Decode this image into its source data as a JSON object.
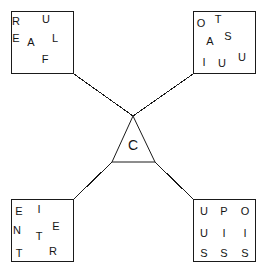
{
  "diagram": {
    "canvas": {
      "width": 267,
      "height": 275,
      "background": "#ffffff"
    },
    "stroke_color": "#1a1a1a",
    "center": {
      "shape": "triangle",
      "label": "C",
      "apex": {
        "x": 133,
        "y": 116
      },
      "bottom_left": {
        "x": 112,
        "y": 162
      },
      "bottom_right": {
        "x": 155,
        "y": 162
      },
      "label_pos": {
        "x": 133,
        "y": 145
      }
    },
    "boxes": [
      {
        "id": "top-left",
        "x": 11,
        "y": 11,
        "w": 63,
        "h": 63,
        "letters": [
          {
            "ch": "R",
            "x": 16,
            "y": 21
          },
          {
            "ch": "U",
            "x": 46,
            "y": 19
          },
          {
            "ch": "E",
            "x": 16,
            "y": 38
          },
          {
            "ch": "A",
            "x": 31,
            "y": 42
          },
          {
            "ch": "L",
            "x": 55,
            "y": 38
          },
          {
            "ch": "F",
            "x": 45,
            "y": 59
          }
        ]
      },
      {
        "id": "top-right",
        "x": 193,
        "y": 11,
        "w": 63,
        "h": 63,
        "letters": [
          {
            "ch": "O",
            "x": 201,
            "y": 23
          },
          {
            "ch": "T",
            "x": 218,
            "y": 19
          },
          {
            "ch": "A",
            "x": 210,
            "y": 41
          },
          {
            "ch": "S",
            "x": 228,
            "y": 36
          },
          {
            "ch": "I",
            "x": 204,
            "y": 62
          },
          {
            "ch": "U",
            "x": 222,
            "y": 63
          },
          {
            "ch": "U",
            "x": 242,
            "y": 57
          }
        ]
      },
      {
        "id": "bottom-left",
        "x": 11,
        "y": 199,
        "w": 63,
        "h": 63,
        "letters": [
          {
            "ch": "E",
            "x": 19,
            "y": 211
          },
          {
            "ch": "I",
            "x": 39,
            "y": 209
          },
          {
            "ch": "N",
            "x": 17,
            "y": 230
          },
          {
            "ch": "T",
            "x": 39,
            "y": 236
          },
          {
            "ch": "E",
            "x": 56,
            "y": 226
          },
          {
            "ch": "T",
            "x": 19,
            "y": 253
          },
          {
            "ch": "R",
            "x": 53,
            "y": 251
          }
        ]
      },
      {
        "id": "bottom-right",
        "x": 193,
        "y": 199,
        "w": 63,
        "h": 63,
        "letters": [
          {
            "ch": "U",
            "x": 204,
            "y": 211
          },
          {
            "ch": "P",
            "x": 224,
            "y": 211
          },
          {
            "ch": "O",
            "x": 245,
            "y": 211
          },
          {
            "ch": "U",
            "x": 204,
            "y": 233
          },
          {
            "ch": "I",
            "x": 224,
            "y": 233
          },
          {
            "ch": "I",
            "x": 245,
            "y": 233
          },
          {
            "ch": "S",
            "x": 204,
            "y": 253
          },
          {
            "ch": "S",
            "x": 224,
            "y": 253
          },
          {
            "ch": "S",
            "x": 245,
            "y": 253
          }
        ]
      }
    ],
    "links": [
      {
        "id": "link-top-left",
        "x1": 74,
        "y1": 74,
        "x2": 133,
        "y2": 116
      },
      {
        "id": "link-top-right",
        "x1": 193,
        "y1": 74,
        "x2": 133,
        "y2": 116
      },
      {
        "id": "link-bottom-left",
        "x1": 74,
        "y1": 199,
        "x2": 112,
        "y2": 162
      },
      {
        "id": "link-bottom-right",
        "x1": 193,
        "y1": 199,
        "x2": 155,
        "y2": 162
      }
    ]
  }
}
